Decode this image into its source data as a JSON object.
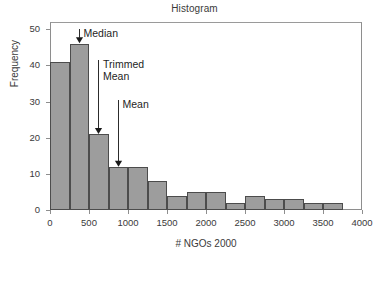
{
  "chart_data": {
    "type": "bar",
    "title": "Histogram",
    "xlabel": "# NGOs 2000",
    "ylabel": "Frequency",
    "grid": false,
    "legend": null,
    "xlim": [
      0,
      4000
    ],
    "ylim": [
      0,
      52
    ],
    "bin_width": 250,
    "x_ticks": [
      0,
      500,
      1000,
      1500,
      2000,
      2500,
      3000,
      3500,
      4000
    ],
    "x_tick_labels": [
      "0",
      "500",
      "1000",
      "1500",
      "2000",
      "2500",
      "3000",
      "3500",
      "4000"
    ],
    "y_ticks": [
      0,
      10,
      20,
      30,
      40,
      50
    ],
    "y_tick_labels": [
      "0",
      "10",
      "20",
      "30",
      "40",
      "50"
    ],
    "bins": [
      {
        "left": 0,
        "right": 250,
        "value": 41
      },
      {
        "left": 250,
        "right": 500,
        "value": 46
      },
      {
        "left": 500,
        "right": 750,
        "value": 21
      },
      {
        "left": 750,
        "right": 1000,
        "value": 12
      },
      {
        "left": 1000,
        "right": 1250,
        "value": 12
      },
      {
        "left": 1250,
        "right": 1500,
        "value": 8
      },
      {
        "left": 1500,
        "right": 1750,
        "value": 4
      },
      {
        "left": 1750,
        "right": 2000,
        "value": 5
      },
      {
        "left": 2000,
        "right": 2250,
        "value": 5
      },
      {
        "left": 2250,
        "right": 2500,
        "value": 2
      },
      {
        "left": 2500,
        "right": 2750,
        "value": 4
      },
      {
        "left": 2750,
        "right": 3000,
        "value": 3
      },
      {
        "left": 3000,
        "right": 3250,
        "value": 3
      },
      {
        "left": 3250,
        "right": 3500,
        "value": 2
      },
      {
        "left": 3500,
        "right": 3750,
        "value": 2
      }
    ],
    "categories": [
      "0-250",
      "250-500",
      "500-750",
      "750-1000",
      "1000-1250",
      "1250-1500",
      "1500-1750",
      "1750-2000",
      "2000-2250",
      "2250-2500",
      "2500-2750",
      "2750-3000",
      "3000-3250",
      "3250-3500",
      "3500-3750"
    ],
    "values": [
      41,
      46,
      21,
      12,
      12,
      8,
      4,
      5,
      5,
      2,
      4,
      3,
      3,
      2,
      2
    ],
    "annotations": [
      {
        "text": "Median",
        "x": 375,
        "y_tip": 46,
        "label_x": 430,
        "label_y": 50.5
      },
      {
        "text": "Trimmed\nMean",
        "x": 625,
        "y_tip": 21,
        "label_x": 680,
        "label_y": 42.0
      },
      {
        "text": "Mean",
        "x": 875,
        "y_tip": 12,
        "label_x": 930,
        "label_y": 31.0
      }
    ],
    "colors": {
      "bar_fill": "#9d9d9d",
      "bar_edge": "#4c4c4c",
      "axis": "#8e8e8e",
      "text": "#3a3a3a",
      "annotation_text": "#1e1e1e",
      "background": "#ffffff"
    }
  }
}
